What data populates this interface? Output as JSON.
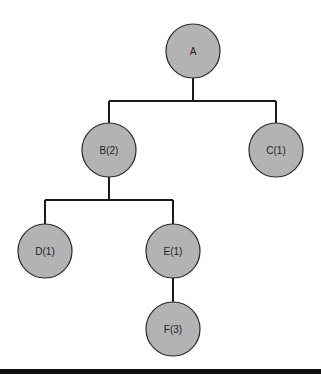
{
  "diagram": {
    "type": "tree",
    "nodes": [
      {
        "id": "A",
        "label": "A",
        "cx": 193,
        "cy": 51,
        "r": 27
      },
      {
        "id": "B",
        "label": "B(2)",
        "cx": 109,
        "cy": 150,
        "r": 27
      },
      {
        "id": "C",
        "label": "C(1)",
        "cx": 276,
        "cy": 150,
        "r": 27
      },
      {
        "id": "D",
        "label": "D(1)",
        "cx": 45,
        "cy": 251,
        "r": 27
      },
      {
        "id": "E",
        "label": "E(1)",
        "cx": 173,
        "cy": 251,
        "r": 27
      },
      {
        "id": "F",
        "label": "F(3)",
        "cx": 173,
        "cy": 329,
        "r": 27
      }
    ],
    "edges": [
      {
        "from": "A",
        "to": "B"
      },
      {
        "from": "A",
        "to": "C"
      },
      {
        "from": "B",
        "to": "D"
      },
      {
        "from": "B",
        "to": "E"
      },
      {
        "from": "E",
        "to": "F"
      }
    ],
    "colors": {
      "node_fill": "#b3b3b3",
      "node_stroke": "#2a2a2a",
      "edge": "#1a1a1a",
      "text": "#1e1e1e",
      "bottom_bar": "#111111"
    }
  }
}
